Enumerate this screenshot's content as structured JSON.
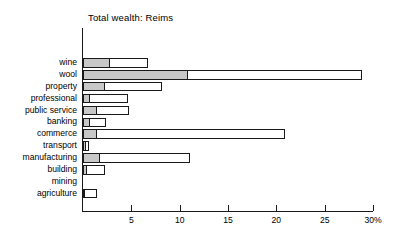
{
  "chart_data": {
    "type": "bar",
    "orientation": "horizontal",
    "title": "Total wealth: Reims",
    "xlabel": "",
    "ylabel": "",
    "xlim": [
      0,
      30
    ],
    "grid": false,
    "legend_position": "none",
    "xticks": [
      {
        "value": 5,
        "label": "5"
      },
      {
        "value": 10,
        "label": "10"
      },
      {
        "value": 15,
        "label": "15"
      },
      {
        "value": 20,
        "label": "20"
      },
      {
        "value": 25,
        "label": "25"
      },
      {
        "value": 30,
        "label": "30%"
      }
    ],
    "categories": [
      "wine",
      "wool",
      "property",
      "professional",
      "public service",
      "banking",
      "commerce",
      "transport",
      "manufacturing",
      "building",
      "mining",
      "agriculture"
    ],
    "series": [
      {
        "name": "inner",
        "fill": "#c8c8c8",
        "values": [
          2.8,
          10.9,
          2.3,
          0.7,
          1.4,
          0.7,
          1.4,
          0.3,
          1.8,
          0.4,
          0.0,
          0.15
        ]
      },
      {
        "name": "outer",
        "fill": "#ffffff",
        "values": [
          6.7,
          28.9,
          8.2,
          4.7,
          4.8,
          2.4,
          20.9,
          0.6,
          11.1,
          2.3,
          0.0,
          1.4
        ]
      }
    ]
  },
  "colors": {
    "inner_fill": "#c8c8c8",
    "outer_fill": "#ffffff",
    "stroke": "#1a1a1a",
    "background": "#ffffff",
    "text": "#000000"
  }
}
